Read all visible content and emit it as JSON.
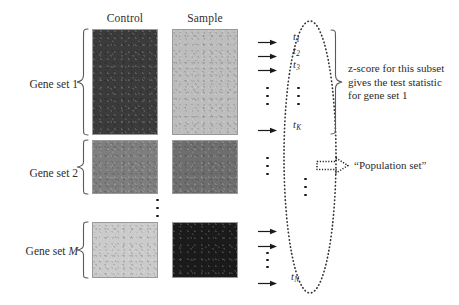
{
  "figure": {
    "type": "gene-set-enrichment-schematic",
    "background": "#ffffff",
    "columns": [
      {
        "id": "control",
        "label": "Control"
      },
      {
        "id": "sample",
        "label": "Sample"
      }
    ],
    "rows": [
      {
        "id": "gene-set-1",
        "label": "Gene set 1",
        "control_shade": "#3b3b3b",
        "sample_shade": "#bdbdbd"
      },
      {
        "id": "gene-set-2",
        "label": "Gene set 2",
        "control_shade": "#7e7e7e",
        "sample_shade": "#6e6e6e"
      },
      {
        "id": "gene-set-m",
        "label": "Gene set M",
        "label_plain": "Gene set ",
        "label_italic": "M",
        "control_shade": "#cbcbcb",
        "sample_shade": "#1b1b1b"
      }
    ],
    "statistics": {
      "top_group": [
        {
          "id": "t1",
          "base": "t",
          "sub": "1"
        },
        {
          "id": "t2",
          "base": "t",
          "sub": "2"
        },
        {
          "id": "t3",
          "base": "t",
          "sub": "3"
        },
        {
          "id": "tK",
          "base": "t",
          "sub": "K"
        }
      ],
      "bottom": {
        "id": "tN",
        "base": "t",
        "sub": "N"
      }
    },
    "annotations": {
      "zscore": {
        "lines": [
          "z-score for this subset",
          "gives the test statistic",
          "for gene set 1"
        ]
      },
      "population": {
        "label": "“Population set”"
      }
    },
    "ellipsis_marker": "vertical-dots",
    "colors": {
      "ink": "#262626",
      "brace": "#5a5a5a",
      "ellipse_dotted": "#3a3a3a",
      "arrow": "#1a1a1a",
      "block_border": "#9a9a9a"
    }
  }
}
